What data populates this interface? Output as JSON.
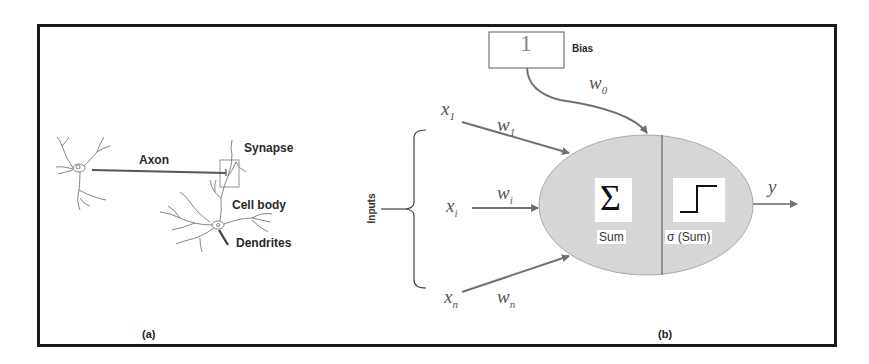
{
  "neuron": {
    "labels": {
      "axon": "Axon",
      "synapse": "Synapse",
      "cell_body": "Cell body",
      "dendrites": "Dendrites"
    },
    "caption": "(a)"
  },
  "perceptron": {
    "bias": {
      "value": "1",
      "label": "Bias",
      "weight": "w",
      "weight_sub": "0"
    },
    "inputs_label": "Inputs",
    "inputs": [
      {
        "x": "x",
        "x_sub": "1",
        "w": "w",
        "w_sub": "1"
      },
      {
        "x": "x",
        "x_sub": "i",
        "w": "w",
        "w_sub": "i"
      },
      {
        "x": "x",
        "x_sub": "n",
        "w": "w",
        "w_sub": "n"
      }
    ],
    "sum_symbol": "Σ",
    "sum_label": "Sum",
    "activation_label": "σ (Sum)",
    "output": "y",
    "caption": "(b)"
  },
  "colors": {
    "frame": "#1a1a1a",
    "node_fill": "#d6d6d6",
    "arrow": "#707070",
    "text": "#222222"
  }
}
